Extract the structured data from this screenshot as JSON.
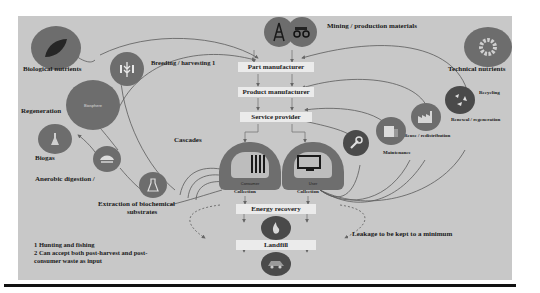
{
  "diagram": {
    "sources": {
      "biological_nutrients": {
        "label": "Biological nutrients",
        "icon": "leaf-icon"
      },
      "technical_nutrients": {
        "label": "Technical nutrients",
        "icon": "gear-icon"
      },
      "mining": {
        "label": "Mining / production materials",
        "icons": [
          "oil-derrick-icon",
          "mining-truck-icon"
        ]
      }
    },
    "chain": [
      {
        "id": "part",
        "label": "Part manufacturer"
      },
      {
        "id": "product",
        "label": "Product manufacturer"
      },
      {
        "id": "service",
        "label": "Service provider"
      }
    ],
    "consumers": [
      {
        "id": "consumer",
        "label": "Consumer",
        "collection": "Collection",
        "icon": "consumer-icon"
      },
      {
        "id": "user",
        "label": "User",
        "collection": "Collection",
        "icon": "user-monitor-icon"
      }
    ],
    "end_of_life": [
      {
        "id": "energy",
        "label": "Energy recovery",
        "icon": "flame-icon"
      },
      {
        "id": "landfill",
        "label": "Landfill",
        "icon": "landfill-truck-icon"
      }
    ],
    "biological_loops": {
      "breeding": {
        "label": "Breeding / harvesting 1",
        "icon": "wheat-icon"
      },
      "regeneration": {
        "label": "Regeneration",
        "icon": "biosphere-icon",
        "inner": "Biosphere"
      },
      "biogas": {
        "label": "Biogas",
        "icon": "biogas-flask-icon"
      },
      "anaerobic": {
        "label": "Anerobic digestion /",
        "icon": "digester-icon"
      },
      "extraction": {
        "label": "Extraction of biochemical substrates",
        "line1": "Extraction of biochemical",
        "line2": "substrates",
        "icon": "lab-flask-icon"
      },
      "cascades": {
        "label": "Cascades"
      }
    },
    "technical_loops": {
      "recycling": {
        "label": "Recycling",
        "icon": "recycling-icon"
      },
      "refurbish": {
        "label": "Renewal / regeneration",
        "icon": "factory-icon"
      },
      "reuse": {
        "label": "Reuse / redistribution"
      },
      "maintenance": {
        "label": "Maintenance",
        "icon": "wrench-icon"
      },
      "maintenance_store": {
        "icon": "store-icon"
      }
    },
    "leakage": {
      "label": "Leakage to be kept to a minimum"
    },
    "footnotes": [
      "1 Hunting and fishing",
      "2 Can accept both post-harvest and post-",
      "consumer waste as input"
    ],
    "colors": {
      "panel": "#c8c8c8",
      "circle": "#6d6d6d",
      "box": "#ebebeb",
      "line": "#555555",
      "rule": "#111111"
    }
  }
}
